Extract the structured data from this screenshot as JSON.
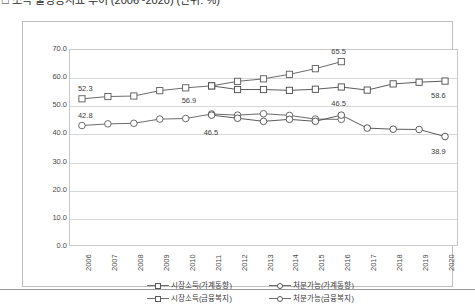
{
  "title": "□ 소득 불평등지표 추이 (2006~2020) (단위: %)",
  "chart_data": {
    "type": "line",
    "title": "□ 소득 불평등지표 추이 (2006~2020) (단위: %)",
    "xlabel": "",
    "ylabel": "",
    "ylim": [
      0.0,
      70.0
    ],
    "ytick_step": 10.0,
    "grid": true,
    "legend_position": "bottom",
    "categories": [
      "2006",
      "2007",
      "2008",
      "2009",
      "2010",
      "2011",
      "2012",
      "2013",
      "2014",
      "2015",
      "2016",
      "2017",
      "2018",
      "2019",
      "2020"
    ],
    "ytick_labels": [
      "0.0",
      "10.0",
      "20.0",
      "30.0",
      "40.0",
      "50.0",
      "60.0",
      "70.0"
    ],
    "series": [
      {
        "name": "시장소득(가계동향)",
        "marker": "square",
        "color": "#5a5a5a",
        "x": [
          "2006",
          "2007",
          "2008",
          "2009",
          "2010",
          "2011",
          "2012",
          "2013",
          "2014",
          "2015",
          "2016"
        ],
        "values": [
          52.3,
          53.1,
          53.3,
          55.2,
          56.2,
          56.9,
          58.5,
          59.4,
          61.0,
          63.0,
          65.5
        ]
      },
      {
        "name": "처분가능(가계동향)",
        "marker": "circle",
        "color": "#5a5a5a",
        "x": [
          "2006",
          "2007",
          "2008",
          "2009",
          "2010",
          "2011",
          "2012",
          "2013",
          "2014",
          "2015",
          "2016"
        ],
        "values": [
          42.8,
          43.4,
          43.6,
          45.1,
          45.3,
          46.9,
          46.5,
          47.0,
          46.4,
          45.1,
          45.0
        ]
      },
      {
        "name": "시장소득(금융복지)",
        "marker": "square",
        "color": "#4a4a4a",
        "x": [
          "2011",
          "2012",
          "2013",
          "2014",
          "2015",
          "2016",
          "2017",
          "2018",
          "2019",
          "2020"
        ],
        "values": [
          56.9,
          55.6,
          55.6,
          55.3,
          55.7,
          56.5,
          55.4,
          57.6,
          58.2,
          58.6
        ]
      },
      {
        "name": "처분가능(금융복지)",
        "marker": "circle",
        "color": "#4a4a4a",
        "x": [
          "2011",
          "2012",
          "2013",
          "2014",
          "2015",
          "2016",
          "2017",
          "2018",
          "2019",
          "2020"
        ],
        "values": [
          46.5,
          45.4,
          44.3,
          45.0,
          44.3,
          46.5,
          41.9,
          41.5,
          41.4,
          38.9
        ]
      }
    ],
    "annotations": [
      {
        "text": "52.3",
        "series": "시장소득(가계동향)",
        "x": "2006"
      },
      {
        "text": "42.8",
        "series": "처분가능(가계동향)",
        "x": "2006"
      },
      {
        "text": "56.9",
        "series": "시장소득(금융복지)",
        "x": "2011"
      },
      {
        "text": "46.5",
        "series": "처분가능(가계동향)",
        "x": "2011"
      },
      {
        "text": "65.5",
        "series": "시장소득(가계동향)",
        "x": "2016"
      },
      {
        "text": "46.5",
        "series": "처분가능(금융복지)",
        "x": "2016"
      },
      {
        "text": "58.6",
        "series": "시장소득(금융복지)",
        "x": "2020"
      },
      {
        "text": "38.9",
        "series": "처분가능(금융복지)",
        "x": "2020"
      }
    ]
  },
  "legend": [
    {
      "label": "시장소득(가계동향)",
      "marker": "square"
    },
    {
      "label": "처분가능(가계동향)",
      "marker": "circle"
    },
    {
      "label": "시장소득(금융복지)",
      "marker": "square"
    },
    {
      "label": "처분가능(금융복지)",
      "marker": "circle"
    }
  ]
}
